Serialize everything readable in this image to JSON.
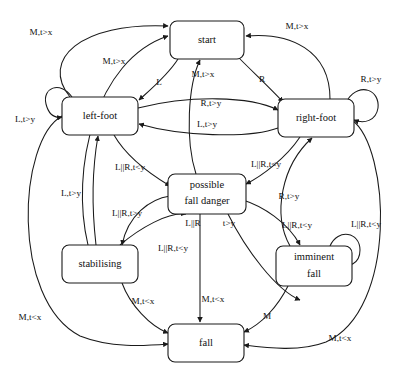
{
  "figure": {
    "type": "state-machine-diagram",
    "title": "",
    "background_color": "#ffffff",
    "line_color": "#1a1a1a",
    "text_color": "#111111"
  },
  "states": [
    {
      "id": "start",
      "label": "start",
      "label_lines": [
        "start"
      ],
      "x": 170,
      "y": 21,
      "w": 74,
      "h": 38
    },
    {
      "id": "left-foot",
      "label": "left-foot",
      "label_lines": [
        "left-foot"
      ],
      "x": 62,
      "y": 97,
      "w": 76,
      "h": 38
    },
    {
      "id": "right-foot",
      "label": "right-foot",
      "label_lines": [
        "right-foot"
      ],
      "x": 278,
      "y": 99,
      "w": 76,
      "h": 38
    },
    {
      "id": "possible-fall-danger",
      "label": "possible fall danger",
      "label_lines": [
        "possible",
        "fall danger"
      ],
      "x": 168,
      "y": 174,
      "w": 78,
      "h": 40
    },
    {
      "id": "stabilising",
      "label": "stabilising",
      "label_lines": [
        "stabilising"
      ],
      "x": 62,
      "y": 245,
      "w": 76,
      "h": 38
    },
    {
      "id": "imminent-fall",
      "label": "imminent fall",
      "label_lines": [
        "imminent",
        "fall"
      ],
      "x": 276,
      "y": 246,
      "w": 76,
      "h": 40
    },
    {
      "id": "fall",
      "label": "fall",
      "label_lines": [
        "fall"
      ],
      "x": 168,
      "y": 324,
      "w": 76,
      "h": 38
    }
  ],
  "transitions": [
    {
      "from": "left-foot",
      "to": "start",
      "label": "M,t>x",
      "label_x": 41,
      "label_y": 33
    },
    {
      "from": "stabilising",
      "to": "start",
      "label": "M,t>x",
      "label_x": 114,
      "label_y": 62
    },
    {
      "from": "right-foot",
      "to": "start",
      "label": "M,t>x",
      "label_x": 297,
      "label_y": 27
    },
    {
      "from": "possible-fall-danger",
      "to": "start",
      "label": "M,t>x",
      "label_x": 203,
      "label_y": 75
    },
    {
      "from": "start",
      "to": "left-foot",
      "label": "L",
      "label_x": 159,
      "label_y": 83
    },
    {
      "from": "start",
      "to": "right-foot",
      "label": "R",
      "label_x": 262,
      "label_y": 80
    },
    {
      "from": "left-foot",
      "to": "right-foot",
      "label": "R,t>y",
      "label_x": 211,
      "label_y": 104
    },
    {
      "from": "right-foot",
      "to": "left-foot",
      "label": "L,t>y",
      "label_x": 207,
      "label_y": 125
    },
    {
      "from": "left-foot",
      "to": "left-foot",
      "label": "L,t>y",
      "label_x": 25,
      "label_y": 120
    },
    {
      "from": "right-foot",
      "to": "right-foot",
      "label": "R,t>y",
      "label_x": 371,
      "label_y": 80
    },
    {
      "from": "stabilising",
      "to": "left-foot",
      "label": "L,t>y",
      "label_x": 71,
      "label_y": 194
    },
    {
      "from": "left-foot",
      "to": "possible-fall-danger",
      "label": "L||R,t<y",
      "label_x": 130,
      "label_y": 168
    },
    {
      "from": "right-foot",
      "to": "possible-fall-danger",
      "label": "L||R,t<y",
      "label_x": 266,
      "label_y": 165
    },
    {
      "from": "possible-fall-danger",
      "to": "stabilising",
      "label": "L||R,t>y",
      "label_x": 127,
      "label_y": 214
    },
    {
      "from": "stabilising",
      "to": "possible-fall-danger",
      "label": "L||R,t<y",
      "label_x": 173,
      "label_y": 249
    },
    {
      "from": "possible-fall-danger",
      "to": "imminent-fall",
      "label": "L||R,t<y",
      "label_x": 297,
      "label_y": 226
    },
    {
      "from": "imminent-fall",
      "to": "right-foot",
      "label": "R,t>y",
      "label_x": 289,
      "label_y": 197
    },
    {
      "from": "imminent-fall",
      "to": "imminent-fall",
      "label": "L||R,t<y",
      "label_x": 366,
      "label_y": 225
    },
    {
      "from": "possible-fall-danger",
      "to": "fall",
      "label": "M,t<x",
      "label_x": 213,
      "label_y": 300
    },
    {
      "from": "possible-fall-danger",
      "to": "fall",
      "label": "L||R",
      "label_x": 195,
      "label_y": 224
    },
    {
      "from": "possible-fall-danger",
      "to": "fall",
      "label": "t>y",
      "label_x": 227,
      "label_y": 224
    },
    {
      "from": "stabilising",
      "to": "fall",
      "label": "M,t<x",
      "label_x": 143,
      "label_y": 302
    },
    {
      "from": "left-foot",
      "to": "fall",
      "label": "M,t<x",
      "label_x": 30,
      "label_y": 318
    },
    {
      "from": "imminent-fall",
      "to": "fall",
      "label": "M",
      "label_x": 267,
      "label_y": 317
    },
    {
      "from": "right-foot",
      "to": "fall",
      "label": "M,t<x",
      "label_x": 340,
      "label_y": 339
    }
  ],
  "edge_labels": [
    "M,t>x",
    "M,t>x",
    "M,t>x",
    "M,t>x",
    "L",
    "R",
    "R,t>y",
    "L,t>y",
    "L,t>y",
    "R,t>y",
    "L,t>y",
    "L||R,t<y",
    "L||R,t<y",
    "L||R,t>y",
    "L||R,t<y",
    "L||R,t<y",
    "R,t>y",
    "L||R,t<y",
    "M,t<x",
    "L||R",
    "t>y",
    "M,t<x",
    "M,t<x",
    "M",
    "M,t<x"
  ]
}
